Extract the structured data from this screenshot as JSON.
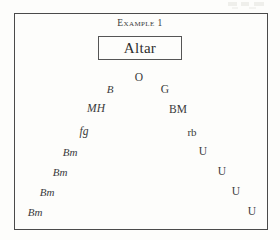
{
  "figure": {
    "caption": "Example 1",
    "altar": {
      "label": "Altar"
    },
    "nodes": [
      {
        "id": "o",
        "label": "O",
        "style": "roman",
        "x": 139,
        "y": 78,
        "size": 11.5
      },
      {
        "id": "b",
        "label": "B",
        "style": "italic",
        "x": 110,
        "y": 89,
        "size": 11
      },
      {
        "id": "g",
        "label": "G",
        "style": "roman",
        "x": 165,
        "y": 90,
        "size": 11.5
      },
      {
        "id": "mh",
        "label": "MH",
        "style": "italic",
        "x": 96,
        "y": 109,
        "size": 11.5
      },
      {
        "id": "bm1",
        "label": "BM",
        "style": "roman",
        "x": 178,
        "y": 110,
        "size": 11.5
      },
      {
        "id": "fg",
        "label": "fg",
        "style": "italic",
        "x": 84,
        "y": 132,
        "size": 11.5
      },
      {
        "id": "rb",
        "label": "rb",
        "style": "roman",
        "x": 192,
        "y": 132,
        "size": 11
      },
      {
        "id": "bm2",
        "label": "Bm",
        "style": "italic",
        "x": 70,
        "y": 152,
        "size": 11
      },
      {
        "id": "u1",
        "label": "U",
        "style": "roman",
        "x": 203,
        "y": 152,
        "size": 11.5
      },
      {
        "id": "bm3",
        "label": "Bm",
        "style": "italic",
        "x": 60,
        "y": 172,
        "size": 11
      },
      {
        "id": "u2",
        "label": "U",
        "style": "roman",
        "x": 222,
        "y": 172,
        "size": 11.5
      },
      {
        "id": "bm4",
        "label": "Bm",
        "style": "italic",
        "x": 47,
        "y": 192,
        "size": 11
      },
      {
        "id": "u3",
        "label": "U",
        "style": "roman",
        "x": 236,
        "y": 192,
        "size": 11.5
      },
      {
        "id": "bm5",
        "label": "Bm",
        "style": "italic",
        "x": 35,
        "y": 212,
        "size": 11
      },
      {
        "id": "u4",
        "label": "U",
        "style": "roman",
        "x": 252,
        "y": 212,
        "size": 11.5
      }
    ]
  },
  "colors": {
    "ink": "#3a3a3a",
    "frame": "#4a4a4a",
    "page": "#fdfdfb"
  }
}
